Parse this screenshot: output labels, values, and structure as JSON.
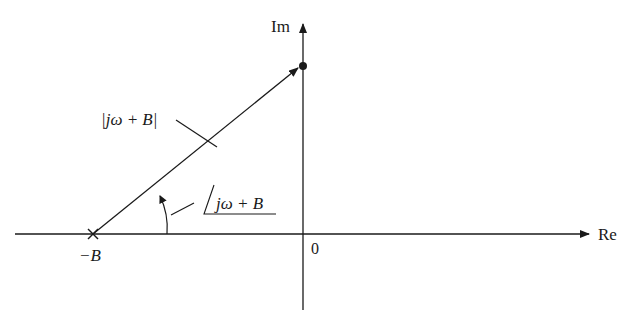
{
  "diagram": {
    "axes": {
      "real_label": "Re",
      "imag_label": "Im",
      "origin_label": "0"
    },
    "pole": {
      "label": "−B",
      "marker": "x-mark"
    },
    "point": {
      "marker": "filled-dot",
      "description": "jω on imaginary axis"
    },
    "vector": {
      "magnitude_label": "|jω + B|",
      "angle_label": "jω + B",
      "angle_symbol": "∠"
    },
    "colors": {
      "stroke": "#1a1a1a",
      "background": "#ffffff"
    }
  }
}
